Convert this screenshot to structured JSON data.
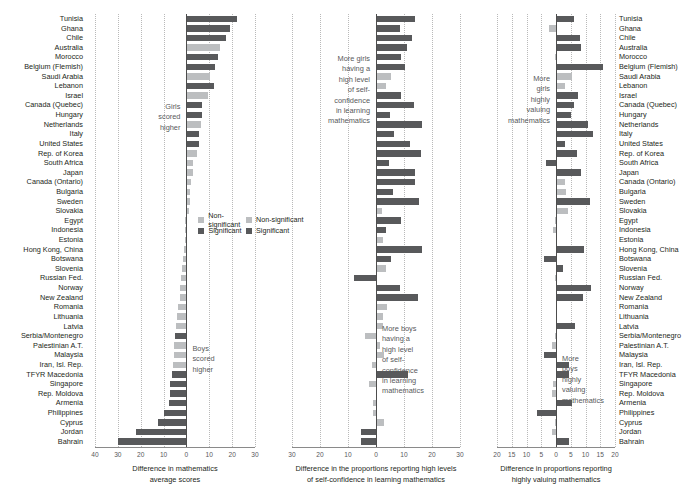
{
  "chart_data": {
    "type": "bar",
    "orientation": "horizontal",
    "title": "",
    "grid": true,
    "legend_position": "middle-left of each panel",
    "legend": [
      {
        "label": "Non-significant",
        "color": "#bcbec0"
      },
      {
        "label": "Significant",
        "color": "#58595b"
      }
    ],
    "categories": [
      "Tunisia",
      "Ghana",
      "Chile",
      "Australia",
      "Morocco",
      "Belgium (Flemish)",
      "Saudi Arabia",
      "Lebanon",
      "Israel",
      "Canada (Quebec)",
      "Hungary",
      "Netherlands",
      "Italy",
      "United States",
      "Rep. of Korea",
      "South Africa",
      "Japan",
      "Canada (Ontario)",
      "Bulgaria",
      "Sweden",
      "Slovakia",
      "Egypt",
      "Indonesia",
      "Estonia",
      "Hong Kong, China",
      "Botswana",
      "Slovenia",
      "Russian Fed.",
      "Norway",
      "New Zealand",
      "Romania",
      "Lithuania",
      "Latvia",
      "Serbia/Montenegro",
      "Palestinian A.T.",
      "Malaysia",
      "Iran, Isl. Rep.",
      "TFYR Macedonia",
      "Singapore",
      "Rep. Moldova",
      "Armenia",
      "Philippines",
      "Cyprus",
      "Jordan",
      "Bahrain"
    ],
    "panels": [
      {
        "id": "math-scores",
        "xlabel": "Difference in mathematics\naverage scores",
        "xlim": [
          -40,
          30
        ],
        "xticks": [
          -40,
          -30,
          -20,
          -10,
          0,
          10,
          20,
          30
        ],
        "xticklabels": [
          "40",
          "30",
          "20",
          "10",
          "0",
          "10",
          "20",
          "30"
        ],
        "annotation_top": "Girls\nscored\nhigher",
        "annotation_bottom": "Boys\nscored\nhigher",
        "values": [
          22.0,
          19.0,
          17.5,
          14.5,
          14.0,
          12.5,
          10.5,
          12.0,
          9.5,
          7.0,
          7.0,
          6.5,
          5.5,
          5.5,
          4.5,
          3.0,
          3.0,
          2.0,
          1.5,
          1.5,
          1.0,
          -0.5,
          -0.5,
          -0.5,
          -1.0,
          -1.5,
          -2.0,
          -2.5,
          -3.0,
          -3.0,
          -3.5,
          -4.0,
          -4.5,
          -5.0,
          -5.5,
          -5.5,
          -6.0,
          -6.5,
          -7.0,
          -7.0,
          -7.5,
          -10.0,
          -12.5,
          -22.0,
          -30.0
        ],
        "significance": [
          "Significant",
          "Significant",
          "Significant",
          "Non-significant",
          "Significant",
          "Significant",
          "Non-significant",
          "Significant",
          "Non-significant",
          "Significant",
          "Significant",
          "Non-significant",
          "Significant",
          "Significant",
          "Non-significant",
          "Non-significant",
          "Non-significant",
          "Non-significant",
          "Non-significant",
          "Non-significant",
          "Non-significant",
          "Non-significant",
          "Non-significant",
          "Non-significant",
          "Non-significant",
          "Non-significant",
          "Non-significant",
          "Non-significant",
          "Non-significant",
          "Non-significant",
          "Non-significant",
          "Non-significant",
          "Non-significant",
          "Significant",
          "Non-significant",
          "Non-significant",
          "Non-significant",
          "Significant",
          "Significant",
          "Significant",
          "Significant",
          "Significant",
          "Significant",
          "Significant",
          "Significant"
        ]
      },
      {
        "id": "self-confidence",
        "xlabel": "Difference in the proportions reporting high levels\nof self-confidence in learning mathematics",
        "xlim": [
          -30,
          30
        ],
        "xticks": [
          -30,
          -20,
          -10,
          0,
          10,
          20,
          30
        ],
        "xticklabels": [
          "30",
          "20",
          "10",
          "0",
          "10",
          "20",
          "30"
        ],
        "annotation_top": "More girls\nhaving a\nhigh level\nof self-\nconfidence\nin learning\nmathematics",
        "annotation_bottom": "More boys\nhaving a\nhigh level\nof self-\nconfidence\nin learning\nmathematics",
        "values": [
          14.0,
          8.5,
          13.0,
          11.0,
          9.0,
          10.5,
          5.5,
          3.5,
          9.0,
          13.5,
          5.0,
          16.5,
          6.5,
          12.0,
          16.0,
          4.5,
          14.0,
          14.0,
          6.0,
          15.5,
          2.0,
          9.0,
          3.5,
          2.5,
          16.5,
          5.5,
          3.5,
          -8.0,
          8.5,
          15.0,
          4.0,
          2.5,
          2.5,
          -4.0,
          1.5,
          3.0,
          -1.5,
          11.5,
          -2.5,
          0.5,
          -1.0,
          -1.0,
          3.0,
          -5.5,
          -5.5
        ],
        "significance": [
          "Significant",
          "Significant",
          "Significant",
          "Significant",
          "Significant",
          "Significant",
          "Non-significant",
          "Non-significant",
          "Significant",
          "Significant",
          "Significant",
          "Significant",
          "Significant",
          "Significant",
          "Significant",
          "Significant",
          "Significant",
          "Significant",
          "Significant",
          "Significant",
          "Non-significant",
          "Significant",
          "Significant",
          "Non-significant",
          "Significant",
          "Significant",
          "Non-significant",
          "Significant",
          "Significant",
          "Significant",
          "Non-significant",
          "Non-significant",
          "Non-significant",
          "Non-significant",
          "Non-significant",
          "Non-significant",
          "Non-significant",
          "Significant",
          "Non-significant",
          "Non-significant",
          "Non-significant",
          "Non-significant",
          "Non-significant",
          "Significant",
          "Significant"
        ]
      },
      {
        "id": "valuing-mathematics",
        "xlabel": "Difference in proportions reporting\nhighly valuing mathematics",
        "xlim": [
          -20,
          20
        ],
        "xticks": [
          -20,
          -15,
          -10,
          -5,
          0,
          5,
          10,
          15,
          20
        ],
        "xticklabels": [
          "20",
          "15",
          "10",
          "5",
          "0",
          "5",
          "10",
          "15",
          "20"
        ],
        "annotation_top": "More\ngirls\nhighly\nvaluing\nmathematics",
        "annotation_bottom": "More\nboys\nhighly\nvaluing\nmathematics",
        "values": [
          6.0,
          -2.5,
          8.0,
          8.5,
          -0.5,
          16.0,
          5.5,
          3.0,
          7.5,
          6.0,
          5.0,
          11.0,
          12.5,
          3.0,
          7.0,
          -3.5,
          8.5,
          3.0,
          3.5,
          11.5,
          4.0,
          -0.5,
          -1.0,
          0.3,
          9.5,
          -4.0,
          2.5,
          -0.5,
          12.0,
          9.0,
          0.2,
          0.2,
          6.5,
          -0.5,
          -1.5,
          -4.0,
          4.5,
          4.5,
          -1.0,
          -1.5,
          5.5,
          -6.5,
          -0.5,
          -1.5,
          4.5
        ],
        "significance": [
          "Significant",
          "Non-significant",
          "Significant",
          "Significant",
          "Non-significant",
          "Significant",
          "Non-significant",
          "Non-significant",
          "Significant",
          "Significant",
          "Significant",
          "Significant",
          "Significant",
          "Significant",
          "Significant",
          "Significant",
          "Significant",
          "Non-significant",
          "Non-significant",
          "Significant",
          "Non-significant",
          "Non-significant",
          "Non-significant",
          "Non-significant",
          "Significant",
          "Significant",
          "Significant",
          "Non-significant",
          "Significant",
          "Significant",
          "Non-significant",
          "Non-significant",
          "Significant",
          "Non-significant",
          "Non-significant",
          "Significant",
          "Significant",
          "Significant",
          "Non-significant",
          "Non-significant",
          "Significant",
          "Significant",
          "Non-significant",
          "Non-significant",
          "Significant"
        ]
      }
    ]
  }
}
